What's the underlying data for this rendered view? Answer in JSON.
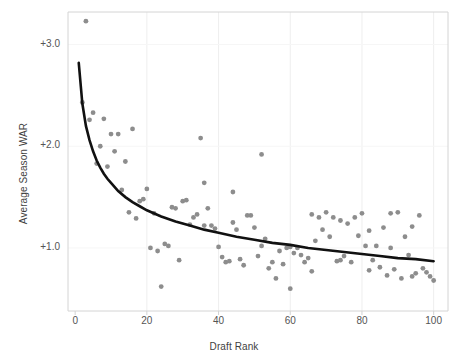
{
  "chart_data": {
    "type": "scatter",
    "title": "",
    "subtitle": "",
    "xlabel": "Draft Rank",
    "ylabel": "Average Season WAR",
    "xlim": [
      -2,
      104
    ],
    "ylim": [
      0.38,
      3.32
    ],
    "xticks": [
      0,
      20,
      40,
      60,
      80,
      100
    ],
    "xtick_labels": [
      "0",
      "20",
      "40",
      "60",
      "80",
      "100"
    ],
    "yticks": [
      1.0,
      2.0,
      3.0
    ],
    "ytick_labels": [
      "+1.0",
      "+2.0",
      "+3.0"
    ],
    "grid": "vertical-light",
    "legend": "none",
    "point_color": "#8d8d8d",
    "point_radius": 2.4,
    "fit_line_color": "#111111",
    "fit_line_width": 2.6,
    "axis_color": "#d4d4d4",
    "series": [
      {
        "name": "Players",
        "x": [
          3,
          2,
          5,
          7,
          9,
          4,
          11,
          13,
          8,
          10,
          16,
          6,
          12,
          14,
          18,
          15,
          17,
          20,
          19,
          22,
          21,
          24,
          23,
          26,
          25,
          28,
          27,
          30,
          29,
          32,
          31,
          34,
          33,
          36,
          35,
          38,
          37,
          40,
          39,
          42,
          41,
          44,
          43,
          46,
          45,
          48,
          47,
          50,
          49,
          52,
          51,
          54,
          53,
          56,
          55,
          58,
          57,
          60,
          59,
          62,
          61,
          64,
          63,
          66,
          65,
          68,
          67,
          70,
          69,
          72,
          71,
          74,
          73,
          76,
          75,
          78,
          77,
          80,
          79,
          82,
          81,
          84,
          83,
          86,
          85,
          88,
          87,
          90,
          89,
          92,
          91,
          94,
          93,
          96,
          95,
          98,
          97,
          99,
          100,
          36,
          44,
          52,
          60,
          66,
          74,
          82,
          88,
          94
        ],
        "y": [
          3.23,
          2.43,
          2.33,
          2.0,
          1.8,
          2.26,
          1.95,
          1.57,
          2.27,
          2.12,
          2.17,
          1.83,
          2.12,
          1.85,
          1.46,
          1.35,
          1.29,
          1.58,
          1.48,
          1.34,
          1.0,
          0.62,
          0.97,
          1.02,
          1.04,
          1.39,
          1.4,
          1.46,
          0.88,
          1.23,
          1.47,
          1.33,
          1.3,
          1.22,
          2.08,
          1.22,
          1.39,
          1.01,
          1.19,
          0.86,
          0.91,
          1.25,
          0.87,
          0.89,
          1.18,
          1.32,
          0.83,
          1.2,
          1.32,
          1.02,
          0.92,
          0.8,
          1.09,
          0.7,
          0.86,
          0.84,
          0.97,
          1.01,
          1.0,
          1.0,
          0.95,
          0.86,
          0.93,
          1.33,
          0.9,
          1.3,
          1.07,
          1.35,
          1.18,
          1.3,
          1.11,
          1.27,
          0.87,
          1.24,
          0.92,
          1.3,
          0.86,
          1.34,
          1.12,
          1.17,
          1.02,
          1.02,
          0.88,
          1.2,
          0.81,
          1.34,
          0.73,
          1.35,
          0.79,
          1.11,
          0.7,
          1.21,
          0.93,
          1.32,
          0.75,
          0.76,
          0.8,
          0.72,
          0.68,
          1.64,
          1.55,
          1.92,
          0.6,
          0.77,
          0.88,
          0.78,
          1.0,
          0.72
        ]
      }
    ],
    "fit_curve": {
      "name": "Power fit",
      "x": [
        1,
        2,
        3,
        4,
        5,
        6,
        7,
        8,
        9,
        10,
        12,
        14,
        16,
        18,
        20,
        24,
        28,
        32,
        36,
        40,
        45,
        50,
        55,
        60,
        65,
        70,
        75,
        80,
        85,
        90,
        95,
        100
      ],
      "y": [
        2.82,
        2.42,
        2.2,
        2.06,
        1.95,
        1.86,
        1.79,
        1.73,
        1.68,
        1.64,
        1.56,
        1.5,
        1.45,
        1.41,
        1.37,
        1.31,
        1.26,
        1.22,
        1.18,
        1.15,
        1.11,
        1.08,
        1.05,
        1.03,
        1.0,
        0.98,
        0.96,
        0.94,
        0.92,
        0.9,
        0.89,
        0.87
      ]
    }
  },
  "axes": {
    "x_title": "Draft Rank",
    "y_title": "Average Season WAR"
  }
}
